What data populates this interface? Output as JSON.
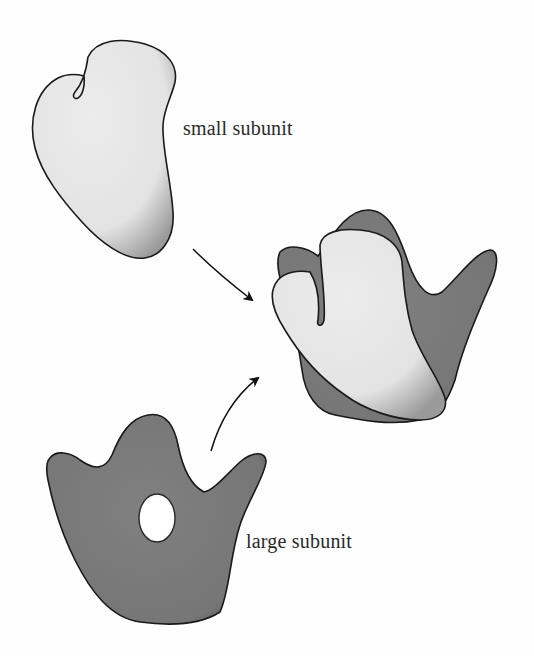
{
  "figure": {
    "labels": {
      "small_subunit": "small subunit",
      "large_subunit": "large subunit"
    },
    "elements": [
      {
        "id": "small-subunit",
        "description": "light gray stippled mitten-shaped small subunit",
        "fill": "#e9e9e9",
        "position": "top-left"
      },
      {
        "id": "large-subunit",
        "description": "dark gray crown-shaped large subunit with central hole",
        "fill": "#7d7d7d",
        "position": "bottom-left"
      },
      {
        "id": "assembled-ribosome",
        "description": "small subunit overlapping large subunit",
        "position": "right-middle"
      },
      {
        "id": "arrow-small-to-assembled",
        "description": "curved arrow from small subunit to assembled ribosome"
      },
      {
        "id": "arrow-large-to-assembled",
        "description": "curved arrow from large subunit to assembled ribosome"
      }
    ]
  },
  "colors": {
    "background": "#fefefe",
    "small_fill": "#e8e8e8",
    "large_fill": "#7a7a7a",
    "outline": "#1a1a1a",
    "text": "#2a2a2a"
  }
}
